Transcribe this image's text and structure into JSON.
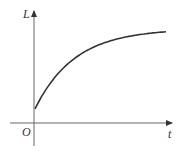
{
  "chart_data": {
    "type": "line",
    "title": "",
    "xlabel": "t",
    "ylabel": "L",
    "origin_label": "O",
    "grid": false,
    "legend": null,
    "series": [
      {
        "name": "L(t)",
        "x": [
          0,
          0.1,
          0.2,
          0.3,
          0.4,
          0.5,
          0.6,
          0.7,
          0.8,
          0.9,
          1.0
        ],
        "values": [
          0.15,
          0.42,
          0.6,
          0.72,
          0.8,
          0.86,
          0.9,
          0.93,
          0.95,
          0.97,
          0.98
        ]
      }
    ],
    "xlim": [
      0,
      1.05
    ],
    "ylim": [
      0,
      1.2
    ]
  },
  "labels": {
    "y_axis": "L",
    "x_axis": "t",
    "origin": "O"
  },
  "colors": {
    "axis": "#555555",
    "curve": "#333333"
  }
}
